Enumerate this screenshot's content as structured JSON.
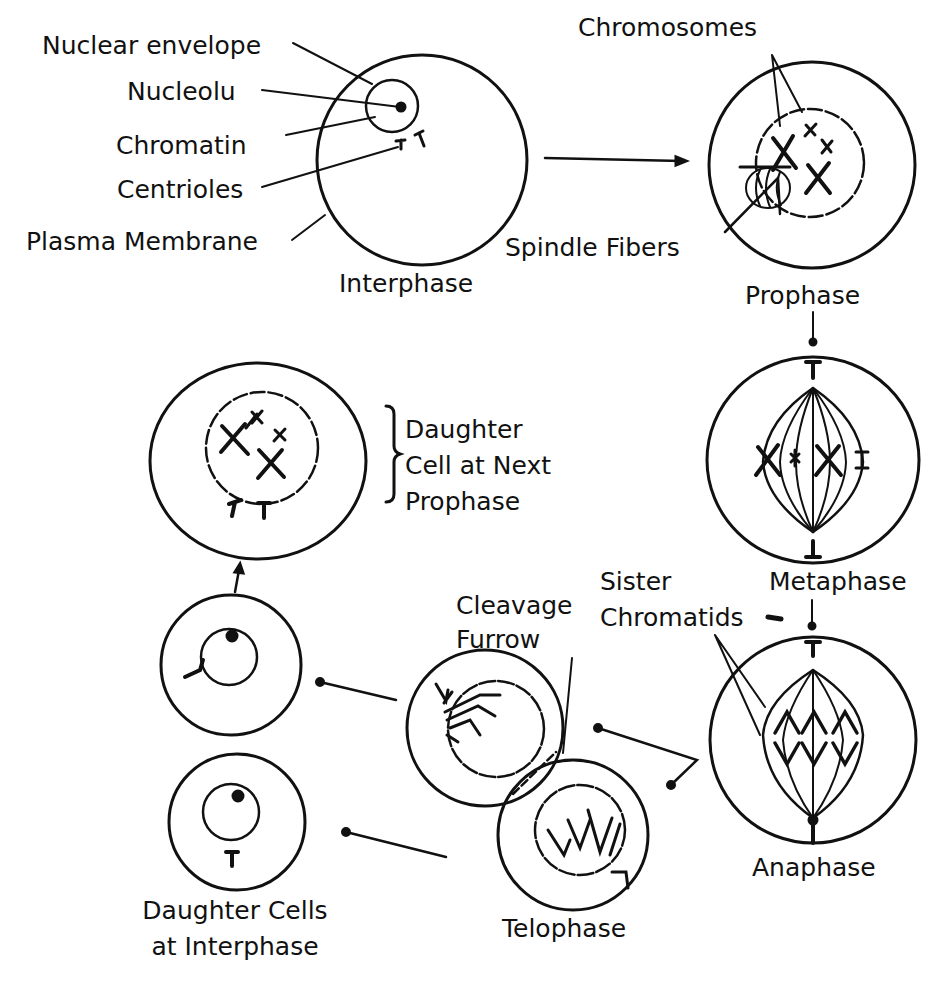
{
  "diagram": {
    "type": "mitosis cell cycle",
    "stages": [
      {
        "id": "interphase",
        "label": "Interphase"
      },
      {
        "id": "prophase",
        "label": "Prophase"
      },
      {
        "id": "metaphase",
        "label": "Metaphase"
      },
      {
        "id": "anaphase",
        "label": "Anaphase"
      },
      {
        "id": "telophase",
        "label": "Telophase"
      },
      {
        "id": "daughter-interphase",
        "label": "Daughter Cells at Interphase"
      },
      {
        "id": "daughter-prophase",
        "label": "Daughter Cell at Next Prophase"
      }
    ],
    "part_labels": {
      "nuclear_envelope": "Nuclear envelope",
      "nucleolus": "Nucleolu",
      "chromatin": "Chromatin",
      "centrioles": "Centrioles",
      "plasma_membrane": "Plasma Membrane",
      "chromosomes": "Chromosomes",
      "spindle_fibers": "Spindle Fibers",
      "sister_chromatids_l1": "Sister",
      "sister_chromatids_l2": "Chromatids",
      "cleavage_furrow_l1": "Cleavage",
      "cleavage_furrow_l2": "Furrow"
    },
    "stage_labels": {
      "interphase": "Interphase",
      "prophase": "Prophase",
      "metaphase": "Metaphase",
      "anaphase": "Anaphase",
      "telophase": "Telophase",
      "daughter_next_l1": "Daughter",
      "daughter_next_l2": "Cell at Next",
      "daughter_next_l3": "Prophase",
      "daughter_inter_l1": "Daughter Cells",
      "daughter_inter_l2": "at Interphase"
    },
    "flow": [
      "Interphase -> Prophase",
      "Prophase -> Metaphase",
      "Metaphase -> Anaphase",
      "Anaphase -> Telophase",
      "Telophase -> Daughter Cells at Interphase",
      "Daughter Cells at Interphase -> Daughter Cell at Next Prophase"
    ]
  }
}
